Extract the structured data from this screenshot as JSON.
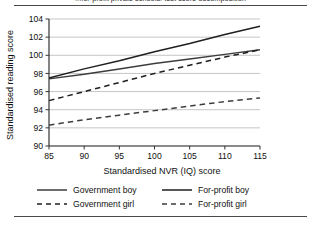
{
  "figure": {
    "title_partial": "...for-profit private schools: test score decomposition",
    "rules": {
      "top": true,
      "bottom": true
    }
  },
  "chart_data": {
    "type": "line",
    "title": "",
    "xlabel": "Standardised NVR (IQ) score",
    "ylabel": "Standardised reading score",
    "xlim": [
      85,
      115
    ],
    "ylim": [
      90,
      104
    ],
    "xticks": [
      85,
      90,
      95,
      100,
      105,
      110,
      115
    ],
    "yticks": [
      90,
      92,
      94,
      96,
      98,
      100,
      102,
      104
    ],
    "grid": "horizontal",
    "legend_position": "bottom",
    "x": [
      85,
      90,
      95,
      100,
      105,
      110,
      115
    ],
    "series": [
      {
        "name": "Government boy",
        "style": "solid",
        "color": "#3d3d3d",
        "values": [
          97.4,
          97.9,
          98.5,
          99.1,
          99.6,
          100.1,
          100.6
        ]
      },
      {
        "name": "For-profit boy",
        "style": "solid",
        "color": "#1f1f1f",
        "values": [
          97.5,
          98.5,
          99.4,
          100.4,
          101.3,
          102.3,
          103.2
        ]
      },
      {
        "name": "Government girl",
        "style": "dashed",
        "color": "#1f1f1f",
        "values": [
          95.0,
          96.0,
          97.0,
          98.0,
          98.9,
          99.8,
          100.6
        ]
      },
      {
        "name": "For-profit girl",
        "style": "dashed",
        "color": "#3d3d3d",
        "values": [
          92.3,
          92.9,
          93.4,
          93.9,
          94.4,
          94.9,
          95.3
        ]
      }
    ]
  },
  "legend": {
    "rows": [
      {
        "left": "Government boy",
        "right": "For-profit boy"
      },
      {
        "left": "Government girl",
        "right": "For-profit girl"
      }
    ]
  }
}
